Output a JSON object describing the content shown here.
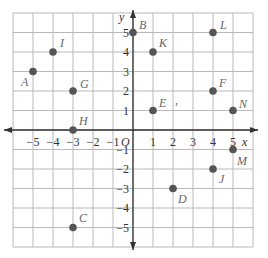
{
  "diagram": {
    "type": "coordinate-plane",
    "x_axis_label": "x",
    "y_axis_label": "y",
    "origin_label": "O",
    "x_ticks": [
      "-5",
      "-4",
      "-3",
      "-2",
      "-1",
      "1",
      "2",
      "3",
      "4",
      "5"
    ],
    "y_ticks": [
      "5",
      "4",
      "3",
      "2",
      "1",
      "-1",
      "-2",
      "-3",
      "-4",
      "-5"
    ],
    "grid_range": {
      "x": [
        -6,
        6
      ],
      "y": [
        -6,
        6
      ]
    },
    "points": [
      {
        "label": "A",
        "x": -5,
        "y": 3
      },
      {
        "label": "B",
        "x": 0,
        "y": 5
      },
      {
        "label": "C",
        "x": -3,
        "y": -5
      },
      {
        "label": "D",
        "x": 2,
        "y": -3
      },
      {
        "label": "E",
        "x": 1,
        "y": 1
      },
      {
        "label": "F",
        "x": 4,
        "y": 2
      },
      {
        "label": "G",
        "x": -3,
        "y": 2
      },
      {
        "label": "H",
        "x": -3,
        "y": 0
      },
      {
        "label": "I",
        "x": -4,
        "y": 4
      },
      {
        "label": "J",
        "x": 4,
        "y": -2
      },
      {
        "label": "K",
        "x": 1,
        "y": 4
      },
      {
        "label": "L",
        "x": 4,
        "y": 5
      },
      {
        "label": "M",
        "x": 5,
        "y": -1
      },
      {
        "label": "N",
        "x": 5,
        "y": 1
      }
    ],
    "stray_mark": ","
  }
}
